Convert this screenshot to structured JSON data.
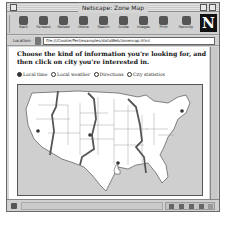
{
  "window": {
    "title": "Netscape: Zone Map"
  },
  "toolbar": {
    "buttons": [
      {
        "label": "Back",
        "icon": "back-arrow-icon"
      },
      {
        "label": "Forward",
        "icon": "forward-arrow-icon"
      },
      {
        "label": "Reload",
        "icon": "reload-icon"
      },
      {
        "label": "Home",
        "icon": "home-icon"
      },
      {
        "label": "Search",
        "icon": "search-icon"
      },
      {
        "label": "Guide",
        "icon": "guide-icon"
      },
      {
        "label": "Images",
        "icon": "images-icon"
      },
      {
        "label": "Print",
        "icon": "print-icon"
      },
      {
        "label": "Security",
        "icon": "security-lock-icon"
      }
    ],
    "logo": "N"
  },
  "location": {
    "label": "Location:",
    "url": "file:///Cookie/Perl/examples/dataWeb/zonemap.html"
  },
  "content": {
    "prompt": "Choose the kind of information you're looking for, and then click on city you're interested in.",
    "radios": [
      {
        "label": "Local time",
        "checked": true
      },
      {
        "label": "Local weather",
        "checked": false
      },
      {
        "label": "Directions",
        "checked": false
      },
      {
        "label": "City statistics",
        "checked": false
      }
    ],
    "map": {
      "alt": "US time zone map",
      "zones": [
        "Pacific",
        "Mountain",
        "Central",
        "Eastern"
      ],
      "city_markers": [
        {
          "name": "west-coast-city"
        },
        {
          "name": "mountain-city"
        },
        {
          "name": "central-city"
        },
        {
          "name": "east-coast-city"
        }
      ]
    }
  },
  "status": {
    "text": ""
  }
}
